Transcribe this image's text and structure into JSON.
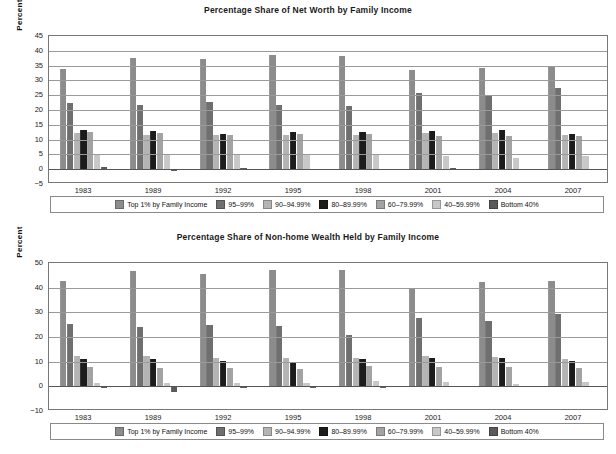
{
  "page": {
    "background": "#ffffff"
  },
  "series_colors": [
    "#8c8c8c",
    "#6f6f6f",
    "#b4b4b4",
    "#1c1c1c",
    "#a3a3a3",
    "#c8c8c8",
    "#5a5a5a"
  ],
  "series_names": [
    "Top 1% by Family Income",
    "95–99%",
    "90–94.99%",
    "80–89.99%",
    "60–79.99%",
    "40–59.99%",
    "Bottom 40%"
  ],
  "charts": [
    {
      "id": "net-worth",
      "title": "Percentage Share of Net Worth by Family Income",
      "ylabel": "Percent",
      "xlabel": "",
      "yticks": [
        45,
        40,
        35,
        30,
        25,
        20,
        15,
        10,
        5,
        0,
        -5
      ],
      "ylim": [
        -5,
        45
      ],
      "grid": true,
      "legend_position": "bottom"
    },
    {
      "id": "non-home-wealth",
      "title": "Percentage Share of Non-home Wealth Held by Family Income",
      "ylabel": "Percent",
      "xlabel": "",
      "yticks": [
        50,
        40,
        30,
        20,
        10,
        0,
        -10
      ],
      "ylim": [
        -10,
        50
      ],
      "grid": true,
      "legend_position": "bottom"
    }
  ],
  "chart_data": [
    {
      "type": "bar",
      "title": "Percentage Share of Net Worth by Family Income",
      "xlabel": "",
      "ylabel": "Percent",
      "ylim": [
        -5,
        45
      ],
      "yticks": [
        -5,
        0,
        5,
        10,
        15,
        20,
        25,
        30,
        35,
        40,
        45
      ],
      "grid": true,
      "legend_position": "bottom",
      "categories": [
        "1983",
        "1989",
        "1992",
        "1995",
        "1998",
        "2001",
        "2004",
        "2007"
      ],
      "series": [
        {
          "name": "Top 1% by Family Income",
          "values": [
            33.8,
            37.4,
            37.2,
            38.5,
            38.1,
            33.4,
            34.3,
            34.6
          ]
        },
        {
          "name": "95–99%",
          "values": [
            22.3,
            21.6,
            22.8,
            21.8,
            21.3,
            25.8,
            24.6,
            27.3
          ]
        },
        {
          "name": "90–94.99%",
          "values": [
            12.1,
            11.6,
            11.7,
            11.5,
            11.5,
            12.3,
            12.3,
            11.5
          ]
        },
        {
          "name": "80–89.99%",
          "values": [
            13.1,
            13.0,
            12.0,
            12.5,
            12.5,
            12.9,
            13.4,
            12.0
          ]
        },
        {
          "name": "60–79.99%",
          "values": [
            12.6,
            12.3,
            11.5,
            11.9,
            11.9,
            11.3,
            11.3,
            11.2
          ]
        },
        {
          "name": "40–59.99%",
          "values": [
            5.2,
            5.2,
            4.8,
            5.2,
            5.1,
            4.3,
            3.8,
            4.3
          ]
        },
        {
          "name": "Bottom 40%",
          "values": [
            0.9,
            -0.7,
            0.4,
            0.2,
            0.2,
            0.3,
            0.2,
            0.2
          ]
        }
      ]
    },
    {
      "type": "bar",
      "title": "Percentage Share of Non-home Wealth Held by Family Income",
      "xlabel": "",
      "ylabel": "Percent",
      "ylim": [
        -10,
        50
      ],
      "yticks": [
        -10,
        0,
        10,
        20,
        30,
        40,
        50
      ],
      "grid": true,
      "legend_position": "bottom",
      "categories": [
        "1983",
        "1989",
        "1992",
        "1995",
        "1998",
        "2001",
        "2004",
        "2007"
      ],
      "series": [
        {
          "name": "Top 1% by Family Income",
          "values": [
            42.9,
            46.9,
            45.6,
            47.2,
            47.3,
            39.7,
            42.2,
            42.7
          ]
        },
        {
          "name": "95–99%",
          "values": [
            25.1,
            24.1,
            25.0,
            24.6,
            21.0,
            27.8,
            26.5,
            29.3
          ]
        },
        {
          "name": "90–94.99%",
          "values": [
            12.3,
            12.4,
            11.5,
            11.3,
            11.4,
            12.3,
            12.0,
            11.0
          ]
        },
        {
          "name": "80–89.99%",
          "values": [
            11.0,
            11.2,
            10.2,
            10.0,
            11.2,
            11.4,
            11.6,
            10.4
          ]
        },
        {
          "name": "60–79.99%",
          "values": [
            8.0,
            7.4,
            7.3,
            6.9,
            8.4,
            7.8,
            7.7,
            7.3
          ]
        },
        {
          "name": "40–59.99%",
          "values": [
            1.4,
            1.3,
            1.5,
            1.2,
            2.0,
            1.7,
            0.8,
            1.6
          ]
        },
        {
          "name": "Bottom 40%",
          "values": [
            -0.8,
            -2.2,
            -0.6,
            -0.7,
            -0.6,
            0.2,
            -0.3,
            0.3
          ]
        }
      ]
    }
  ]
}
